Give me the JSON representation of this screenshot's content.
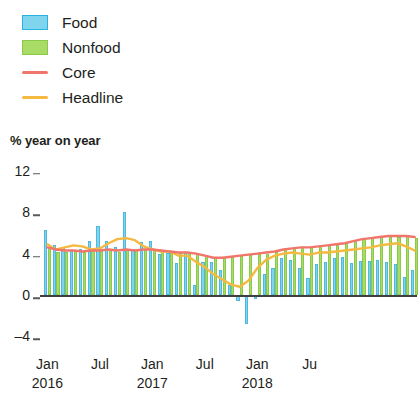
{
  "legend": {
    "items": [
      {
        "label": "Food",
        "type": "box",
        "icon": "square-swatch-icon",
        "color": "#7fd4ee",
        "border": "#29b2de"
      },
      {
        "label": "Nonfood",
        "type": "box",
        "icon": "square-swatch-icon",
        "color": "#a9db67",
        "border": "#8bc94a"
      },
      {
        "label": "Core",
        "type": "line",
        "icon": "line-swatch-icon",
        "color": "#f0756a",
        "border": "#f0756a"
      },
      {
        "label": "Headline",
        "type": "line",
        "icon": "line-swatch-icon",
        "color": "#f5b840",
        "border": "#f5b840"
      }
    ]
  },
  "axis": {
    "unit_caption": "% year on year",
    "y_ticks": [
      12,
      8,
      4,
      0,
      -4
    ],
    "y_tick_labels": [
      "12",
      "8",
      "4",
      "0",
      "–4"
    ],
    "x_tick_labels": [
      "Jan",
      "Jul",
      "Jan",
      "Jul",
      "Jan",
      "Ju"
    ],
    "x_tick_years": [
      "2016",
      "",
      "2017",
      "",
      "2018",
      ""
    ]
  },
  "chart_data": {
    "type": "bar",
    "title": "",
    "subtitle": "",
    "xlabel": "",
    "ylabel": "% year on year",
    "ylim": [
      -4,
      12
    ],
    "grid": false,
    "legend_position": "top-left",
    "annotations": [],
    "x": [
      "2016-01",
      "2016-02",
      "2016-03",
      "2016-04",
      "2016-05",
      "2016-06",
      "2016-07",
      "2016-08",
      "2016-09",
      "2016-10",
      "2016-11",
      "2016-12",
      "2017-01",
      "2017-02",
      "2017-03",
      "2017-04",
      "2017-05",
      "2017-06",
      "2017-07",
      "2017-08",
      "2017-09",
      "2017-10",
      "2017-11",
      "2017-12",
      "2018-01",
      "2018-02",
      "2018-03",
      "2018-04",
      "2018-05",
      "2018-06",
      "2018-07",
      "2018-08",
      "2018-09",
      "2018-10",
      "2018-11",
      "2018-12",
      "2019-01",
      "2019-02",
      "2019-03",
      "2019-04",
      "2019-05",
      "2019-06",
      "2019-07"
    ],
    "x_major_ticks": [
      "2016-01",
      "2016-07",
      "2017-01",
      "2017-07",
      "2018-01",
      "2018-07"
    ],
    "series": [
      {
        "name": "Food",
        "kind": "bar",
        "color": "#7fd4ee",
        "values": [
          6.3,
          4.8,
          4.6,
          4.3,
          4.4,
          5.2,
          6.7,
          5.2,
          4.6,
          8.0,
          4.4,
          5.1,
          5.2,
          4.0,
          4.1,
          3.1,
          4.2,
          1.0,
          3.2,
          3.2,
          2.4,
          1.0,
          -0.6,
          -2.8,
          -0.4,
          2.0,
          2.6,
          3.6,
          3.4,
          2.6,
          1.6,
          3.0,
          3.2,
          3.6,
          3.7,
          3.1,
          3.3,
          3.3,
          3.4,
          3.2,
          3.0,
          1.7,
          2.4
        ]
      },
      {
        "name": "Nonfood",
        "kind": "bar",
        "color": "#a9db67",
        "values": [
          4.5,
          4.2,
          4.2,
          4.3,
          4.2,
          4.3,
          4.3,
          4.4,
          4.2,
          4.4,
          4.3,
          4.4,
          4.4,
          4.3,
          4.1,
          4.1,
          4.1,
          4.0,
          3.9,
          3.7,
          3.7,
          3.8,
          3.8,
          3.9,
          4.0,
          4.0,
          4.2,
          4.4,
          4.5,
          4.6,
          4.6,
          4.7,
          4.8,
          4.8,
          5.0,
          5.2,
          5.4,
          5.5,
          5.6,
          5.6,
          5.6,
          5.7,
          5.5
        ]
      },
      {
        "name": "Core",
        "kind": "line",
        "color": "#f0756a",
        "values": [
          4.6,
          4.4,
          4.3,
          4.3,
          4.2,
          4.3,
          4.3,
          4.4,
          4.3,
          4.4,
          4.3,
          4.4,
          4.4,
          4.3,
          4.2,
          4.1,
          4.1,
          4.0,
          3.8,
          3.6,
          3.6,
          3.7,
          3.8,
          3.9,
          4.0,
          4.1,
          4.2,
          4.4,
          4.5,
          4.6,
          4.6,
          4.7,
          4.8,
          4.9,
          5.0,
          5.2,
          5.4,
          5.5,
          5.6,
          5.7,
          5.7,
          5.7,
          5.6
        ]
      },
      {
        "name": "Headline",
        "kind": "line",
        "color": "#f5b840",
        "values": [
          4.9,
          4.4,
          4.6,
          4.8,
          4.7,
          4.4,
          4.5,
          5.0,
          5.4,
          5.5,
          5.3,
          4.7,
          4.4,
          4.2,
          4.2,
          3.8,
          3.8,
          3.2,
          2.7,
          2.0,
          1.5,
          1.0,
          0.8,
          1.4,
          2.6,
          3.4,
          3.8,
          4.0,
          4.1,
          4.0,
          3.9,
          4.1,
          4.1,
          4.2,
          4.3,
          4.4,
          4.5,
          4.6,
          4.8,
          4.9,
          5.0,
          4.7,
          4.3
        ]
      }
    ]
  }
}
